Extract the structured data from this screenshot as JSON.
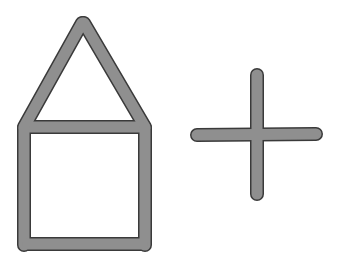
{
  "diagram": {
    "colors": {
      "stick_fill": "#8f8f8f",
      "stick_outline": "#3a3a3a",
      "background": "#ffffff"
    },
    "stick_width": 12,
    "figures": [
      {
        "name": "house",
        "sticks": [
          {
            "id": "roof-left",
            "x1": 24,
            "y1": 127,
            "x2": 82,
            "y2": 23
          },
          {
            "id": "roof-right",
            "x1": 84,
            "y1": 23,
            "x2": 145,
            "y2": 127
          },
          {
            "id": "ceiling",
            "x1": 27,
            "y1": 127,
            "x2": 143,
            "y2": 127
          },
          {
            "id": "wall-left",
            "x1": 24,
            "y1": 128,
            "x2": 24,
            "y2": 245
          },
          {
            "id": "wall-right",
            "x1": 145,
            "y1": 128,
            "x2": 145,
            "y2": 245
          },
          {
            "id": "floor",
            "x1": 28,
            "y1": 244,
            "x2": 142,
            "y2": 244
          }
        ]
      },
      {
        "name": "plus-sign",
        "sticks": [
          {
            "id": "plus-horizontal",
            "x1": 197,
            "y1": 135,
            "x2": 316,
            "y2": 134
          },
          {
            "id": "plus-vertical",
            "x1": 257,
            "y1": 75,
            "x2": 257,
            "y2": 194
          }
        ]
      }
    ]
  }
}
